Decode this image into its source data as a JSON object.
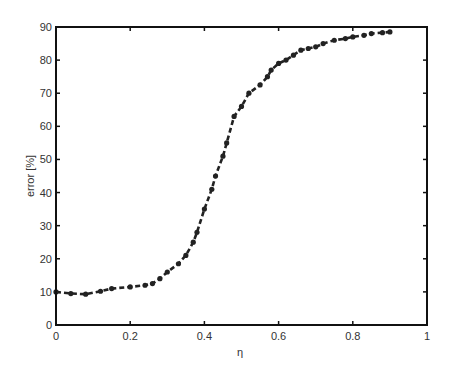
{
  "chart_data": {
    "type": "line",
    "title": "",
    "xlabel": "η",
    "ylabel": "error [%]",
    "xlim": [
      0,
      1
    ],
    "ylim": [
      0,
      90
    ],
    "xticks": [
      "0",
      "0.2",
      "0.4",
      "0.6",
      "0.8",
      "1"
    ],
    "yticks": [
      "0",
      "10",
      "20",
      "30",
      "40",
      "50",
      "60",
      "70",
      "80",
      "90"
    ],
    "grid": false,
    "legend": null,
    "series": [
      {
        "name": "error",
        "style": "dashed line with dot markers",
        "color": "#222222",
        "x": [
          0.0,
          0.04,
          0.08,
          0.12,
          0.15,
          0.2,
          0.24,
          0.26,
          0.28,
          0.3,
          0.33,
          0.35,
          0.37,
          0.38,
          0.4,
          0.42,
          0.43,
          0.45,
          0.46,
          0.48,
          0.5,
          0.52,
          0.55,
          0.57,
          0.58,
          0.6,
          0.62,
          0.64,
          0.66,
          0.68,
          0.7,
          0.72,
          0.75,
          0.78,
          0.8,
          0.83,
          0.85,
          0.88,
          0.9
        ],
        "values": [
          10,
          9.5,
          9.3,
          10.2,
          11,
          11.5,
          12,
          12.5,
          14,
          16,
          18.5,
          21,
          25,
          28,
          35,
          41,
          45,
          51,
          55,
          63,
          66,
          70,
          72.5,
          75,
          77,
          79,
          80,
          81.5,
          83,
          83.5,
          84,
          85,
          86,
          86.5,
          87,
          87.5,
          88,
          88.3,
          88.5
        ]
      }
    ]
  },
  "axes": {
    "xlabel": "η",
    "ylabel": "error [%]"
  }
}
